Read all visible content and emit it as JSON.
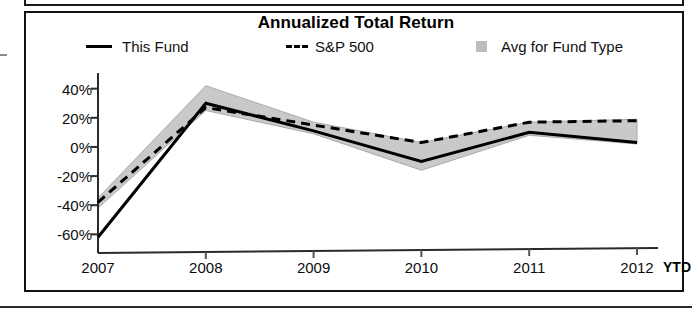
{
  "chart_data": {
    "type": "line",
    "title": "Annualized Total Return",
    "xlabel": "",
    "ylabel": "",
    "x": [
      "2007",
      "2008",
      "2009",
      "2010",
      "2011",
      "2012"
    ],
    "categories": [
      "2007",
      "2008",
      "2009",
      "2010",
      "2011",
      "2012"
    ],
    "x_axis_note": "YTD",
    "ytick_labels": [
      "40%",
      "20%",
      "0%",
      "-20%",
      "-40%",
      "-60%"
    ],
    "ytick_values": [
      40,
      20,
      0,
      -20,
      -40,
      -60
    ],
    "ylim": [
      -68,
      48
    ],
    "grid": false,
    "legend_position": "top",
    "series": [
      {
        "name": "This Fund",
        "style": "solid",
        "color": "#000000",
        "values": [
          -62,
          30,
          11,
          -10,
          10,
          3
        ]
      },
      {
        "name": "S&P 500",
        "style": "dashed",
        "color": "#000000",
        "values": [
          -38,
          27,
          15,
          3,
          17,
          18
        ]
      },
      {
        "name": "Avg for Fund Type",
        "style": "band",
        "color": "#c9c9c9",
        "band_upper": [
          -35,
          42,
          17,
          3,
          17,
          19
        ],
        "band_lower": [
          -42,
          25,
          9,
          -16,
          8,
          2
        ]
      }
    ],
    "legend": [
      {
        "label": "This Fund",
        "marker": "solid-line"
      },
      {
        "label": "S&P 500",
        "marker": "dashed-line"
      },
      {
        "label": "Avg for Fund Type",
        "marker": "gray-square"
      }
    ]
  }
}
